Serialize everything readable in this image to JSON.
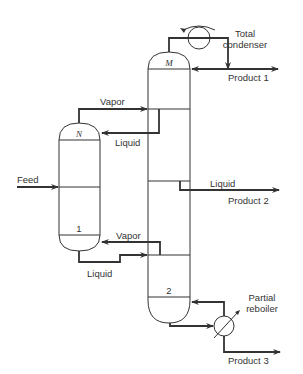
{
  "diagram": {
    "type": "distillation-column-schematic",
    "labels": {
      "total_condenser_line1": "Total",
      "total_condenser_line2": "condenser",
      "product1": "Product 1",
      "product2": "Product 2",
      "product3": "Product 3",
      "partial_reboiler_line1": "Partial",
      "partial_reboiler_line2": "reboiler",
      "vapor_top": "Vapor",
      "liquid_top": "Liquid",
      "vapor_bottom": "Vapor",
      "liquid_bottom": "Liquid",
      "liquid_side": "Liquid",
      "feed": "Feed",
      "main_column_top_stage": "M",
      "main_column_bottom_stage": "2",
      "side_column_top_stage": "N",
      "side_column_bottom_stage": "1"
    },
    "colors": {
      "line": "#333333",
      "background": "#ffffff"
    }
  }
}
